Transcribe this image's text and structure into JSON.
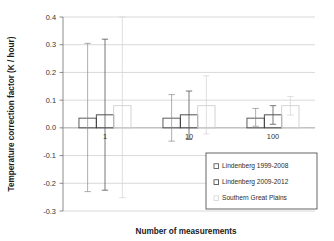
{
  "chart_data": {
    "type": "bar",
    "title": "",
    "subtitle": "",
    "xlabel": "Number of measurements",
    "ylabel": "Temperature correction factor (K / hour)",
    "categories": [
      "1",
      "10",
      "100"
    ],
    "ylim": [
      -0.3,
      0.4
    ],
    "yticks": [
      "0.4",
      "0.3",
      "0.2",
      "0.1",
      "0.0",
      "-0.1",
      "-0.2",
      "-0.3"
    ],
    "ytick_values": [
      0.4,
      0.3,
      0.2,
      0.1,
      0.0,
      -0.1,
      -0.2,
      -0.3
    ],
    "grid": "horizontal",
    "legend_position": "bottom-right",
    "error_bars": "asymmetric-whiskers",
    "series": [
      {
        "name": "Lindenberg 1999-2008",
        "color": "#4a4a4a",
        "values": [
          0.035,
          0.035,
          0.035
        ],
        "err_upper": [
          0.305,
          0.12,
          0.07
        ],
        "err_lower": [
          -0.23,
          -0.048,
          0.006
        ]
      },
      {
        "name": "Lindenberg 2009-2012",
        "color": "#3c3c3c",
        "values": [
          0.047,
          0.047,
          0.047
        ],
        "err_upper": [
          0.32,
          0.133,
          0.08
        ],
        "err_lower": [
          -0.225,
          -0.042,
          0.013
        ]
      },
      {
        "name": "Southern Great Plains",
        "color": "#d4d4d4",
        "values": [
          0.08,
          0.08,
          0.08
        ],
        "err_upper": [
          0.4,
          0.188,
          0.113
        ],
        "err_lower": [
          -0.252,
          -0.022,
          0.046
        ]
      }
    ]
  },
  "axes": {
    "y_title": "Temperature correction factor (K / hour)",
    "x_title": "Number of measurements"
  },
  "legend": {
    "items": [
      {
        "label": "Lindenberg 1999-2008"
      },
      {
        "label": "Lindenberg 2009-2012"
      },
      {
        "label": "Southern Great Plains"
      }
    ]
  }
}
